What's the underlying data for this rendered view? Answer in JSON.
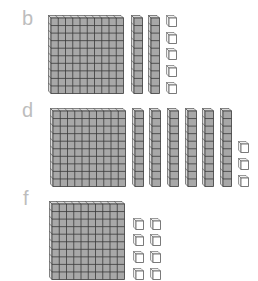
{
  "sections": [
    {
      "label": "b",
      "hundreds": 1,
      "tens": 2,
      "ones": 5
    },
    {
      "label": "d",
      "hundreds": 1,
      "tens": 6,
      "ones": 3
    },
    {
      "label": "f",
      "hundreds": 1,
      "tens": 0,
      "ones": 8
    }
  ],
  "colors": {
    "label": "#bdbdbd",
    "block_front": "#a8a8a8",
    "block_side": "#d9d9d9",
    "block_line": "#3a3a3a",
    "unit_front": "#ffffff",
    "unit_side": "#f0f0f0",
    "unit_line": "#5a5a5a"
  }
}
